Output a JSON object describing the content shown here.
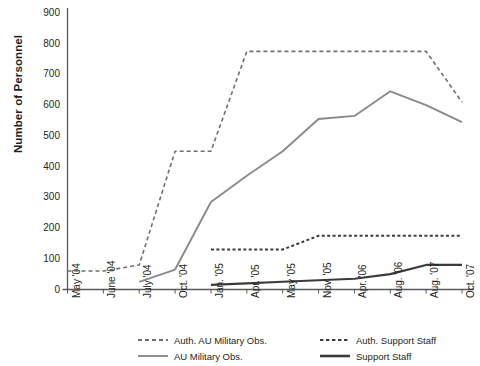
{
  "chart_data": {
    "type": "line",
    "title": "",
    "xlabel": "",
    "ylabel": "Number of Personnel",
    "ylim": [
      0,
      900
    ],
    "ytick_step": 100,
    "yticks": [
      0,
      100,
      200,
      300,
      400,
      500,
      600,
      700,
      800,
      900
    ],
    "grid": false,
    "legend_position": "bottom",
    "categories": [
      "May '04",
      "June '04",
      "July '04",
      "Oct. '04",
      "Jan. '05",
      "Apr. '05",
      "May '05",
      "Nov. '05",
      "Apr. '06",
      "Aug. '06",
      "Aug. '07",
      "Oct. '07"
    ],
    "series": [
      {
        "name": "Auth. AU Military Obs.",
        "style": "dashed",
        "color": "#6f6f6f",
        "width": 1.6,
        "dash": "4,3",
        "values": [
          60,
          60,
          80,
          450,
          450,
          775,
          775,
          775,
          775,
          775,
          775,
          610
        ]
      },
      {
        "name": "AU Military Obs.",
        "style": "solid",
        "color": "#8a8a8a",
        "width": 1.9,
        "dash": "",
        "values": [
          null,
          null,
          25,
          65,
          285,
          370,
          450,
          555,
          565,
          645,
          600,
          545
        ]
      },
      {
        "name": "Auth. Support Staff",
        "style": "dotted",
        "color": "#3b3b3b",
        "width": 2.0,
        "dash": "3,2.4",
        "values": [
          null,
          null,
          null,
          null,
          130,
          130,
          130,
          175,
          175,
          175,
          175,
          175
        ]
      },
      {
        "name": "Support Staff",
        "style": "solid",
        "color": "#3b3b3b",
        "width": 2.1,
        "dash": "",
        "values": [
          null,
          null,
          null,
          null,
          15,
          20,
          25,
          30,
          35,
          50,
          80,
          80
        ]
      }
    ]
  },
  "legend": {
    "items": [
      {
        "label": "Auth. AU Military Obs."
      },
      {
        "label": "Auth. Support Staff"
      },
      {
        "label": "AU Military Obs."
      },
      {
        "label": "Support Staff"
      }
    ]
  }
}
